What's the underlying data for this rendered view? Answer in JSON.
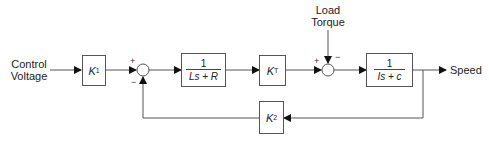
{
  "diagram": {
    "type": "control-system-block-diagram",
    "input_label": [
      "Control",
      "Voltage"
    ],
    "disturbance_label": [
      "Load",
      "Torque"
    ],
    "output_label": "Speed",
    "blocks": [
      {
        "id": "k1",
        "symbol": "K",
        "subscript": "1"
      },
      {
        "id": "electrical",
        "numerator": "1",
        "denominator": "Ls + R"
      },
      {
        "id": "kt",
        "symbol": "K",
        "subscript": "T"
      },
      {
        "id": "mechanical",
        "numerator": "1",
        "denominator": "Is + c"
      },
      {
        "id": "k2",
        "symbol": "K",
        "subscript": "2"
      }
    ],
    "summing_junctions": [
      {
        "id": "sum1",
        "signs": {
          "left": "+",
          "bottom": "−"
        }
      },
      {
        "id": "sum2",
        "signs": {
          "left": "+",
          "top": "−"
        }
      }
    ],
    "line_color": "#555555"
  }
}
